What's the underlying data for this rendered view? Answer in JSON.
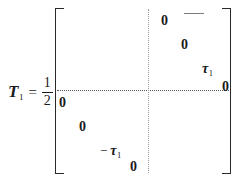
{
  "figure": {
    "kind": "math-equation",
    "background_color": "#ffffff",
    "text_color": "#1a1a1a"
  },
  "lhs": {
    "symbol": "T",
    "symbol_subscript": "1",
    "equals": "=",
    "fraction": {
      "numerator": "1",
      "denominator": "2"
    }
  },
  "matrix": {
    "bracket_left": "[",
    "bracket_right": "]",
    "partition": {
      "horizontal": "dotted",
      "vertical": "dotted",
      "color": "#555555"
    },
    "upper_right_block": [
      {
        "id": "ur-1",
        "text": "0",
        "minus": ""
      },
      {
        "id": "ur-2",
        "text": "0",
        "minus": ""
      },
      {
        "id": "ur-3",
        "text": "τ",
        "subscript": "1",
        "minus": ""
      },
      {
        "id": "ur-4",
        "text": "0",
        "minus": ""
      }
    ],
    "lower_left_block": [
      {
        "id": "ll-1",
        "text": "0",
        "minus": ""
      },
      {
        "id": "ll-2",
        "text": "0",
        "minus": ""
      },
      {
        "id": "ll-3",
        "text": "τ",
        "subscript": "1",
        "minus": "−"
      },
      {
        "id": "ll-4",
        "text": "0",
        "minus": ""
      }
    ]
  },
  "entries": {
    "ur1": "0",
    "ur2": "0",
    "ur3_tau": "τ",
    "ur3_sub": "1",
    "ur4": "0",
    "ll1": "0",
    "ll2": "0",
    "ll3_minus": "−",
    "ll3_tau": "τ",
    "ll3_sub": "1",
    "ll4": "0"
  }
}
